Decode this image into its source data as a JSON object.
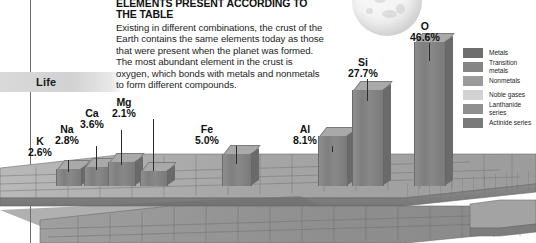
{
  "headline": {
    "title": "ELEMENTS PRESENT ACCORDING TO THE TABLE",
    "body": "Existing in different combinations, the crust of the Earth contains the same elements today as those that were present when the planet was formed. The most abundant element in the crust is oxygen, which bonds with metals and nonmetals to form different compounds."
  },
  "axis": {
    "life_label": "Life"
  },
  "legend": {
    "items": [
      {
        "label": "Metals",
        "color": "#6e6e6e"
      },
      {
        "label": "Transition metals",
        "color": "#858585"
      },
      {
        "label": "Nonmetals",
        "color": "#9a9a9a"
      },
      {
        "label": "Noble gases",
        "color": "#d2d2d2"
      },
      {
        "label": "Lanthanide series",
        "color": "#8f8f8f"
      },
      {
        "label": "Actinide series",
        "color": "#7a7a7a"
      }
    ]
  },
  "chart_data": {
    "type": "bar",
    "title": "ELEMENTS PRESENT ACCORDING TO THE TABLE",
    "xlabel": "",
    "ylabel": "Abundance in Earth's crust (%)",
    "ylim": [
      0,
      50
    ],
    "unit": "%",
    "categories": [
      "K",
      "Na",
      "Ca",
      "Mg",
      "Fe",
      "Al",
      "Si",
      "O"
    ],
    "values": [
      2.6,
      2.8,
      3.6,
      2.1,
      5.0,
      8.1,
      27.7,
      46.6
    ],
    "labels": [
      "2.6%",
      "2.8%",
      "3.6%",
      "2.1%",
      "5.0%",
      "8.1%",
      "27.7%",
      "46.6%"
    ],
    "legend_position": "right",
    "grid": false
  },
  "bars": [
    {
      "symbol": "K",
      "pct": "2.6%",
      "x": 56,
      "w": 24,
      "h": 17,
      "lx": 28,
      "ly": 136,
      "leader_top": 160,
      "leader_h": 12
    },
    {
      "symbol": "Na",
      "pct": "2.8%",
      "x": 84,
      "w": 24,
      "h": 19,
      "lx": 55,
      "ly": 124,
      "leader_top": 146,
      "leader_h": 24
    },
    {
      "symbol": "Ca",
      "pct": "3.6%",
      "x": 108,
      "w": 26,
      "h": 24,
      "lx": 80,
      "ly": 108,
      "leader_top": 130,
      "leader_h": 35
    },
    {
      "symbol": "Mg",
      "pct": "2.1%",
      "x": 140,
      "w": 26,
      "h": 15,
      "lx": 112,
      "ly": 97,
      "leader_top": 119,
      "leader_h": 52
    },
    {
      "symbol": "Fe",
      "pct": "5.0%",
      "x": 222,
      "w": 28,
      "h": 32,
      "lx": 195,
      "ly": 124,
      "leader_top": 146,
      "leader_h": 18
    },
    {
      "symbol": "Al",
      "pct": "8.1%",
      "x": 318,
      "w": 28,
      "h": 50,
      "lx": 293,
      "ly": 124,
      "leader_top": 146,
      "leader_h": 6
    },
    {
      "symbol": "Si",
      "pct": "27.7%",
      "x": 352,
      "w": 30,
      "h": 96,
      "lx": 348,
      "ly": 57,
      "leader_top": 79,
      "leader_h": 22
    },
    {
      "symbol": "O",
      "pct": "46.6%",
      "x": 414,
      "w": 30,
      "h": 144,
      "lx": 410,
      "ly": 21,
      "leader_top": 43,
      "leader_h": 18
    }
  ]
}
